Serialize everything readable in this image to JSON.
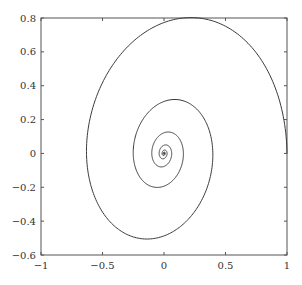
{
  "chart_data": {
    "type": "line",
    "title": "",
    "xlabel": "",
    "ylabel": "",
    "xlim": [
      -1,
      1
    ],
    "ylim": [
      -0.6,
      0.8
    ],
    "grid": false,
    "legend": null,
    "x_ticks": [
      -1,
      -0.5,
      0,
      0.5,
      1
    ],
    "x_tick_labels": [
      "−1",
      "−0.5",
      "0",
      "0.5",
      "1"
    ],
    "y_ticks": [
      -0.6,
      -0.4,
      -0.2,
      0,
      0.2,
      0.4,
      0.6,
      0.8
    ],
    "y_tick_labels": [
      "−0.6",
      "−0.4",
      "−0.2",
      "0",
      "0.2",
      "0.4",
      "0.6",
      "0.8"
    ],
    "line_color": "#3a3a3a",
    "series": [
      {
        "name": "spiral",
        "description": "Damped spiral trajectory starting at (1, 0), rotating counter-clockwise and converging to the origin",
        "model": {
          "x": "exp(-a*t)*(cos(t) + b*sin(t))",
          "y": "c*exp(-a*t)*sin(t)",
          "a": 0.147,
          "b": 0.126,
          "c": 1.0,
          "t_max": 40
        },
        "key_points": [
          {
            "x": 1.0,
            "y": 0.0
          },
          {
            "x": 0.1,
            "y": 0.8
          },
          {
            "x": -0.63,
            "y": 0.1
          },
          {
            "x": -0.05,
            "y": -0.5
          },
          {
            "x": 0.4,
            "y": -0.04
          },
          {
            "x": 0.04,
            "y": 0.32
          },
          {
            "x": -0.25,
            "y": 0.02
          },
          {
            "x": -0.04,
            "y": -0.2
          },
          {
            "x": 0.15,
            "y": 0.0
          },
          {
            "x": 0.0,
            "y": 0.12
          },
          {
            "x": -0.14,
            "y": 0.0
          },
          {
            "x": 0.0,
            "y": 0.0
          }
        ]
      }
    ]
  }
}
